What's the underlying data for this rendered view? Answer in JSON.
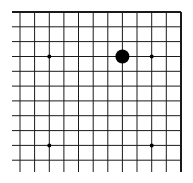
{
  "board": {
    "type": "go-board-fragment",
    "view": "upper-right-corner",
    "columns_visible": 12,
    "rows_visible": 11,
    "line_color": "#1a1a1a",
    "background_color": "#ffffff",
    "edges": {
      "top": true,
      "right": true,
      "left": false,
      "bottom": false
    },
    "grid": {
      "x": [
        20,
        34.6,
        49.3,
        63.9,
        78.5,
        93.2,
        107.8,
        122.4,
        137,
        151.7,
        166.3,
        181
      ],
      "y": [
        12,
        26.8,
        41.6,
        56.5,
        71.3,
        86.1,
        100.9,
        115.7,
        130.6,
        145.4,
        160.2
      ],
      "h_line_start_x": 12,
      "v_line_end_y": 172
    },
    "star_points": [
      {
        "col": 2,
        "row": 3
      },
      {
        "col": 9,
        "row": 3
      },
      {
        "col": 2,
        "row": 9
      },
      {
        "col": 9,
        "row": 9
      }
    ],
    "stones": [
      {
        "color": "black",
        "col": 7,
        "row": 3
      }
    ]
  }
}
